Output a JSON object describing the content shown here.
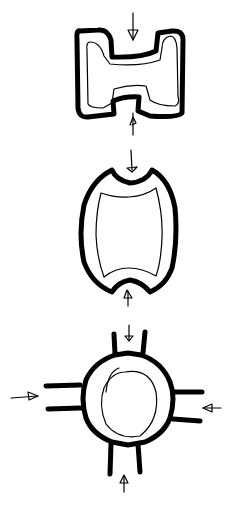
{
  "diagram": {
    "title": "",
    "background": "#ffffff",
    "stroke_color": "#000000",
    "style": "hand-drawn sketch",
    "shapes": [
      {
        "id": "h-shape",
        "description": "H-shaped block with thick outer wall and thin inner outline",
        "arrows": [
          "top-down",
          "bottom-up"
        ]
      },
      {
        "id": "barrel-shape",
        "description": "Barrel/concave-ended shape with thick outer wall and thin inner outline",
        "arrows": [
          "top-down",
          "bottom-up"
        ]
      },
      {
        "id": "circle-node",
        "description": "Circular node with four port openings and inner circle",
        "arrows": [
          "top-down",
          "bottom-up",
          "left-in",
          "right-in"
        ]
      }
    ]
  }
}
